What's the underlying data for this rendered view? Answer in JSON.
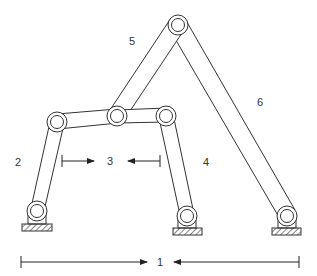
{
  "diagram": {
    "type": "six-bar linkage mechanism",
    "colors": {
      "stroke": "#333333",
      "background": "#ffffff",
      "hatch": "#333333"
    },
    "labels": {
      "link1": "1",
      "link2": "2",
      "link3": "3",
      "link4": "4",
      "link5": "5",
      "link6": "6"
    },
    "joints": [
      {
        "id": "apex",
        "x": 178,
        "y": 25
      },
      {
        "id": "left-upper",
        "x": 57,
        "y": 122
      },
      {
        "id": "middle",
        "x": 117,
        "y": 116
      },
      {
        "id": "right-upper",
        "x": 166,
        "y": 116
      },
      {
        "id": "ground-left",
        "x": 37,
        "y": 211
      },
      {
        "id": "ground-mid",
        "x": 187,
        "y": 216
      },
      {
        "id": "ground-right",
        "x": 287,
        "y": 216
      }
    ],
    "dimensions": [
      {
        "label": "3",
        "from_x": 63,
        "to_x": 160,
        "y": 161
      },
      {
        "label": "1",
        "from_x": 21,
        "to_x": 298,
        "y": 262
      }
    ]
  }
}
